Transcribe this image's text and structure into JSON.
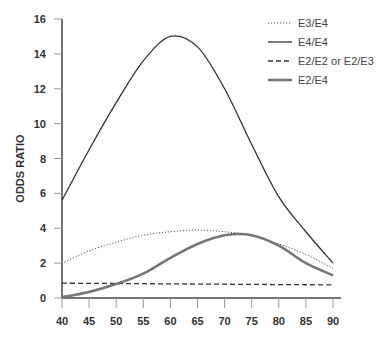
{
  "chart_data": {
    "type": "line",
    "title": "",
    "xlabel": "",
    "ylabel": "ODDS RATIO",
    "x": [
      40,
      45,
      50,
      55,
      60,
      65,
      70,
      75,
      80,
      85,
      90
    ],
    "xticks": [
      "40",
      "45",
      "50",
      "55",
      "60",
      "65",
      "70",
      "75",
      "80",
      "85",
      "90"
    ],
    "yticks": [
      "0",
      "2",
      "4",
      "6",
      "8",
      "10",
      "12",
      "14",
      "16"
    ],
    "xlim": [
      40,
      90
    ],
    "ylim": [
      0,
      16
    ],
    "grid": false,
    "legend_position": "top-right",
    "series": [
      {
        "name": "E3/E4",
        "style": "dotted",
        "color": "#555555",
        "values": [
          2.0,
          2.7,
          3.2,
          3.6,
          3.8,
          3.9,
          3.8,
          3.6,
          3.1,
          2.5,
          1.7
        ]
      },
      {
        "name": "E4/E4",
        "style": "solid",
        "color": "#333333",
        "values": [
          5.6,
          8.5,
          11.2,
          13.6,
          15.0,
          14.4,
          12.0,
          8.8,
          5.8,
          3.8,
          2.0
        ]
      },
      {
        "name": "E2/E2 or E2/E3",
        "style": "dashed",
        "color": "#333333",
        "values": [
          0.85,
          0.84,
          0.83,
          0.82,
          0.81,
          0.8,
          0.79,
          0.78,
          0.77,
          0.76,
          0.75
        ]
      },
      {
        "name": "E2/E4",
        "style": "solid-thick",
        "color": "#777777",
        "values": [
          0.05,
          0.35,
          0.8,
          1.4,
          2.3,
          3.1,
          3.6,
          3.6,
          3.0,
          2.0,
          1.3
        ]
      }
    ]
  }
}
